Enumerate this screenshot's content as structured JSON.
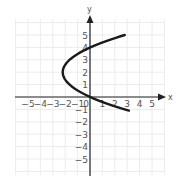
{
  "chart_data": {
    "type": "line",
    "title": "",
    "xlabel": "x",
    "ylabel": "y",
    "xlim": [
      -5.8,
      6
    ],
    "ylim": [
      -6.2,
      6.6
    ],
    "grid": true,
    "x_ticks": [
      -5,
      -4,
      -3,
      -2,
      -1,
      0,
      1,
      2,
      3,
      4,
      5
    ],
    "y_ticks": [
      -5,
      -4,
      -3,
      -2,
      -1,
      1,
      2,
      3,
      4,
      5
    ],
    "x_tick_labels": [
      "−5",
      "−4",
      "−3",
      "−2",
      "−1",
      "0",
      "1",
      "2",
      "3",
      "4",
      "5"
    ],
    "y_tick_labels": [
      "−5",
      "−4",
      "−3",
      "−2",
      "−1",
      "1",
      "2",
      "3",
      "4",
      "5"
    ],
    "series": [
      {
        "name": "parabola opening right",
        "equation_estimate": "x = 0.55(y - 2)^2 - 2.2",
        "vertex": [
          -2.2,
          2
        ],
        "endpoints": [
          [
            2.8,
            5.0
          ],
          [
            2.8,
            -1.1
          ]
        ],
        "y_intercepts": [
          4.6,
          -0.6
        ],
        "x_intercept": -0.0
      }
    ]
  },
  "labels": {
    "x_axis": "x",
    "y_axis": "y"
  },
  "colors": {
    "curve": "#1a1a1a",
    "axis": "#222222",
    "grid": "#ececec"
  }
}
